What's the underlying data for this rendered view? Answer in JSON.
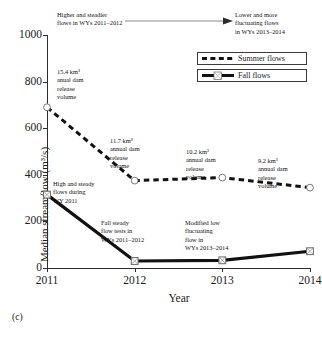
{
  "figure": {
    "panel_label": "(c)"
  },
  "chart_data": {
    "type": "line",
    "title": "",
    "subtitle": "",
    "xlabel": "Year",
    "ylabel": "Median streamflow (m3/s)",
    "ylabel_display": "Median streamflow (m³/s)",
    "categories": [
      "2011",
      "2012",
      "2013",
      "2014"
    ],
    "x": [
      2011,
      2012,
      2013,
      2014
    ],
    "xlim": [
      2011,
      2014
    ],
    "ylim": [
      0,
      1000
    ],
    "grid": false,
    "legend_position": "top-right",
    "y_ticks": [
      0,
      200,
      400,
      600,
      800,
      1000
    ],
    "y_tick_labels": [
      "0",
      "200",
      "400",
      "600",
      "800",
      "1000"
    ],
    "x_ticks": [
      2011,
      2012,
      2013,
      2014
    ],
    "x_tick_labels": [
      "2011",
      "2012",
      "2013",
      "2014"
    ],
    "series": [
      {
        "name": "Summer flows",
        "style": "dashed",
        "marker": "open-circle",
        "color": "#111111",
        "values": [
          690,
          375,
          388,
          345
        ]
      },
      {
        "name": "Fall flows",
        "style": "solid",
        "marker": "open-square",
        "color": "#111111",
        "values": [
          315,
          30,
          33,
          72
        ]
      }
    ],
    "annotations": [
      {
        "id": "higher-steadier",
        "text": "Higher and steadier\nflows in WYs 2011–2012"
      },
      {
        "id": "lower-fluctuating",
        "text": "Lower and more\nfluctuating flows\nin WYs 2013–2014"
      },
      {
        "id": "volume-2011",
        "text": "15.4 km³\nanual dam\nrelease\nvolume"
      },
      {
        "id": "volume-2012",
        "text": "11.7 km³\nannual dam\nrelease\nvolume"
      },
      {
        "id": "volume-2013",
        "text": "10.2 km³\nannual dam\nrelease\nvolume"
      },
      {
        "id": "volume-2014",
        "text": "9.2 km³\nannual dam\nrelease\nvolume"
      },
      {
        "id": "high-steady",
        "text": "High and steady\nflows during\nWY 2011"
      },
      {
        "id": "fall-steady-tests",
        "text": "Fall steady\nflow tests in\nWYs 2011–2012"
      },
      {
        "id": "modified-low",
        "text": "Modified low\nfluctuating\nflow in\nWYs 2013–2014"
      }
    ]
  },
  "legend": {
    "entries": [
      {
        "label": "Summer flows"
      },
      {
        "label": "Fall flows"
      }
    ]
  }
}
